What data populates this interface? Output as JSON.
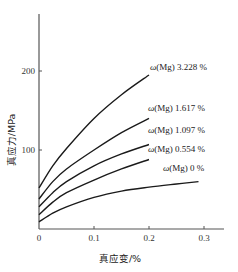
{
  "chart_data": {
    "type": "line",
    "title": "",
    "xlabel": "真应变/%",
    "ylabel": "真应力/MPa",
    "xlim": [
      0,
      0.33
    ],
    "ylim": [
      0,
      250
    ],
    "xticks": [
      0,
      0.1,
      0.2,
      0.3
    ],
    "xtick_labels": [
      "0",
      "0.1",
      "0.2",
      "0.3"
    ],
    "yticks": [
      100,
      200
    ],
    "ytick_labels": [
      "100",
      "200"
    ],
    "grid": false,
    "legend": "inline labels at curve ends",
    "series": [
      {
        "name": "ω(Mg) 3.228 %",
        "label_prefix": "ω",
        "label_mid": "(Mg)",
        "label_value": "3.228 %",
        "x": [
          0,
          0.025,
          0.05,
          0.1,
          0.15,
          0.2
        ],
        "values": [
          52,
          80,
          102,
          140,
          170,
          195
        ]
      },
      {
        "name": "ω(Mg) 1.617 %",
        "label_prefix": "ω",
        "label_mid": "(Mg)",
        "label_value": "1.617 %",
        "x": [
          0,
          0.025,
          0.05,
          0.1,
          0.15,
          0.2
        ],
        "values": [
          38,
          60,
          76,
          100,
          122,
          140
        ]
      },
      {
        "name": "ω(Mg) 1.097 %",
        "label_prefix": "ω",
        "label_mid": "(Mg)",
        "label_value": "1.097 %",
        "x": [
          0,
          0.025,
          0.05,
          0.1,
          0.15,
          0.2
        ],
        "values": [
          28,
          46,
          60,
          80,
          95,
          107
        ]
      },
      {
        "name": "ω(Mg) 0.554 %",
        "label_prefix": "ω",
        "label_mid": "(Mg)",
        "label_value": "0.554 %",
        "x": [
          0,
          0.025,
          0.05,
          0.1,
          0.15,
          0.2
        ],
        "values": [
          18,
          34,
          46,
          62,
          76,
          88
        ]
      },
      {
        "name": "ω(Mg) 0 %",
        "label_prefix": "ω",
        "label_mid": "(Mg)",
        "label_value": "0 %",
        "x": [
          0,
          0.025,
          0.05,
          0.1,
          0.15,
          0.2,
          0.25,
          0.29
        ],
        "values": [
          9,
          20,
          28,
          40,
          48,
          53,
          57,
          60
        ]
      }
    ]
  },
  "layout": {
    "origin_px": [
      39,
      229
    ],
    "x_px_per_unit": 550,
    "y_px_per_unit": 0.79,
    "y_axis_top_px": 14,
    "x_axis_right_px": 224,
    "label_positions": [
      {
        "x": 150,
        "y": 70
      },
      {
        "x": 148,
        "y": 111
      },
      {
        "x": 148,
        "y": 133
      },
      {
        "x": 148,
        "y": 152
      },
      {
        "x": 163,
        "y": 171
      }
    ],
    "line_color": "#1a1a1a",
    "axis_color": "#555555"
  }
}
